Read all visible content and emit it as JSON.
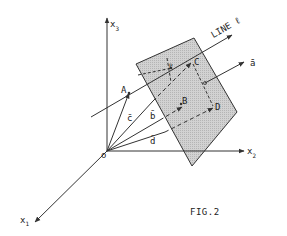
{
  "figure": {
    "caption": "FIG.2",
    "colors": {
      "stroke": "#333333",
      "plane_fill": "#c9c9c9",
      "background": "#ffffff"
    },
    "axes": {
      "x1": {
        "label": "x",
        "sub": "1"
      },
      "x2": {
        "label": "x",
        "sub": "2"
      },
      "x3": {
        "label": "x",
        "sub": "3"
      },
      "origin": {
        "label": "o"
      }
    },
    "line": {
      "label": "LINE ℓ"
    },
    "normal_vector": {
      "label": "ā"
    },
    "points": {
      "A": "A",
      "B": "B",
      "C": "C",
      "D": "D",
      "P": "P"
    },
    "vectors": {
      "b": "b̄",
      "c": "c̄",
      "d": "d̄"
    }
  }
}
